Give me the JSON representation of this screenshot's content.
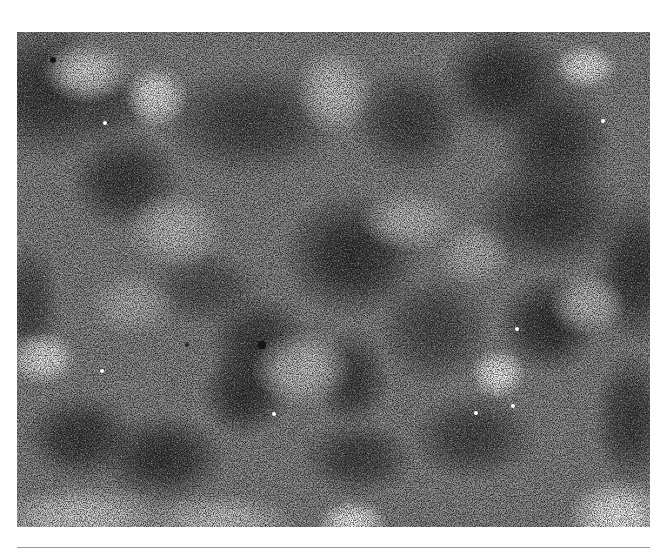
{
  "figure": {
    "kind": "grayscale micrograph",
    "frame": {
      "x": 17,
      "y": 32,
      "width": 633,
      "height": 495
    },
    "base_color": "#8a8a8a",
    "dark_regions": [
      {
        "cx": 0.05,
        "cy": 0.12,
        "rx": 60,
        "ry": 55,
        "color": "#3a3a3a"
      },
      {
        "cx": 0.17,
        "cy": 0.3,
        "rx": 45,
        "ry": 40,
        "color": "#3c3c3c"
      },
      {
        "cx": 0.14,
        "cy": 0.15,
        "rx": 35,
        "ry": 30,
        "color": "#505050"
      },
      {
        "cx": 0.37,
        "cy": 0.18,
        "rx": 70,
        "ry": 45,
        "color": "#454545"
      },
      {
        "cx": 0.53,
        "cy": 0.45,
        "rx": 55,
        "ry": 50,
        "color": "#353535"
      },
      {
        "cx": 0.62,
        "cy": 0.18,
        "rx": 45,
        "ry": 45,
        "color": "#444444"
      },
      {
        "cx": 0.77,
        "cy": 0.1,
        "rx": 50,
        "ry": 45,
        "color": "#333333"
      },
      {
        "cx": 0.85,
        "cy": 0.22,
        "rx": 45,
        "ry": 50,
        "color": "#3a3a3a"
      },
      {
        "cx": 0.84,
        "cy": 0.37,
        "rx": 60,
        "ry": 45,
        "color": "#3d3d3d"
      },
      {
        "cx": 0.98,
        "cy": 0.48,
        "rx": 35,
        "ry": 60,
        "color": "#383838"
      },
      {
        "cx": 0.84,
        "cy": 0.59,
        "rx": 40,
        "ry": 40,
        "color": "#333333"
      },
      {
        "cx": 0.38,
        "cy": 0.63,
        "rx": 40,
        "ry": 40,
        "color": "#3c3c3c"
      },
      {
        "cx": 0.53,
        "cy": 0.7,
        "rx": 30,
        "ry": 40,
        "color": "#404040"
      },
      {
        "cx": 0.36,
        "cy": 0.73,
        "rx": 35,
        "ry": 35,
        "color": "#363636"
      },
      {
        "cx": 0.1,
        "cy": 0.82,
        "rx": 45,
        "ry": 35,
        "color": "#3a3a3a"
      },
      {
        "cx": 0.23,
        "cy": 0.86,
        "rx": 50,
        "ry": 35,
        "color": "#383838"
      },
      {
        "cx": 0.54,
        "cy": 0.86,
        "rx": 45,
        "ry": 30,
        "color": "#444444"
      },
      {
        "cx": 0.72,
        "cy": 0.82,
        "rx": 50,
        "ry": 35,
        "color": "#474747"
      },
      {
        "cx": 0.97,
        "cy": 0.78,
        "rx": 30,
        "ry": 55,
        "color": "#3f3f3f"
      },
      {
        "cx": 0.3,
        "cy": 0.52,
        "rx": 45,
        "ry": 30,
        "color": "#555555"
      },
      {
        "cx": 0.66,
        "cy": 0.6,
        "rx": 45,
        "ry": 45,
        "color": "#4d4d4d"
      },
      {
        "cx": 0.02,
        "cy": 0.55,
        "rx": 25,
        "ry": 50,
        "color": "#4a4a4a"
      }
    ],
    "light_regions": [
      {
        "cx": 0.11,
        "cy": 0.08,
        "rx": 35,
        "ry": 25,
        "color": "#e6e6e6"
      },
      {
        "cx": 0.22,
        "cy": 0.13,
        "rx": 25,
        "ry": 25,
        "color": "#f0f0f0"
      },
      {
        "cx": 0.25,
        "cy": 0.4,
        "rx": 40,
        "ry": 30,
        "color": "#c8c8c8"
      },
      {
        "cx": 0.5,
        "cy": 0.12,
        "rx": 30,
        "ry": 35,
        "color": "#d6d6d6"
      },
      {
        "cx": 0.9,
        "cy": 0.07,
        "rx": 25,
        "ry": 18,
        "color": "#f8f8f8"
      },
      {
        "cx": 0.04,
        "cy": 0.66,
        "rx": 28,
        "ry": 22,
        "color": "#f2f2f2"
      },
      {
        "cx": 0.45,
        "cy": 0.68,
        "rx": 40,
        "ry": 30,
        "color": "#cccccc"
      },
      {
        "cx": 0.76,
        "cy": 0.69,
        "rx": 22,
        "ry": 20,
        "color": "#ffffff"
      },
      {
        "cx": 0.62,
        "cy": 0.38,
        "rx": 40,
        "ry": 25,
        "color": "#c4c4c4"
      },
      {
        "cx": 0.95,
        "cy": 0.98,
        "rx": 40,
        "ry": 30,
        "color": "#ffffff"
      },
      {
        "cx": 0.53,
        "cy": 0.99,
        "rx": 28,
        "ry": 18,
        "color": "#ffffff"
      },
      {
        "cx": 0.1,
        "cy": 0.98,
        "rx": 70,
        "ry": 25,
        "color": "#dcdcdc"
      },
      {
        "cx": 0.32,
        "cy": 0.99,
        "rx": 60,
        "ry": 22,
        "color": "#d4d4d4"
      },
      {
        "cx": 0.72,
        "cy": 0.45,
        "rx": 30,
        "ry": 25,
        "color": "#bdbdbd"
      },
      {
        "cx": 0.18,
        "cy": 0.55,
        "rx": 35,
        "ry": 25,
        "color": "#bababa"
      },
      {
        "cx": 0.9,
        "cy": 0.55,
        "rx": 30,
        "ry": 25,
        "color": "#c6c6c6"
      }
    ],
    "specks": [
      {
        "x": 53,
        "y": 60,
        "r": 3,
        "color": "#151515"
      },
      {
        "x": 262,
        "y": 345,
        "r": 4,
        "color": "#151515"
      },
      {
        "x": 187,
        "y": 345,
        "r": 2,
        "color": "#222222"
      },
      {
        "x": 105,
        "y": 123,
        "r": 2,
        "color": "#ffffff"
      },
      {
        "x": 517,
        "y": 329,
        "r": 2,
        "color": "#ffffff"
      },
      {
        "x": 513,
        "y": 406,
        "r": 2,
        "color": "#ffffff"
      },
      {
        "x": 476,
        "y": 413,
        "r": 2,
        "color": "#ffffff"
      },
      {
        "x": 274,
        "y": 414,
        "r": 2,
        "color": "#ffffff"
      },
      {
        "x": 102,
        "y": 371,
        "r": 2,
        "color": "#ffffff"
      },
      {
        "x": 603,
        "y": 121,
        "r": 2,
        "color": "#ffffff"
      }
    ]
  },
  "rule": {
    "color": "#9a9a9a"
  }
}
